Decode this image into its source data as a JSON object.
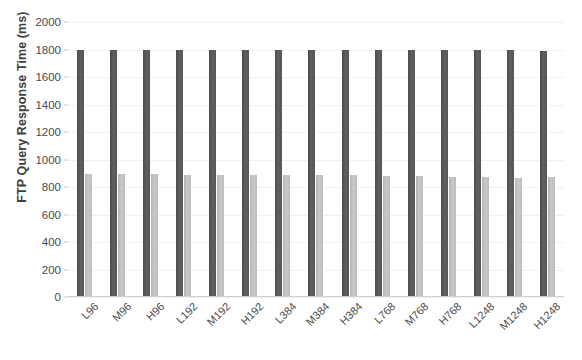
{
  "chart_data": {
    "type": "bar",
    "title": "",
    "xlabel": "",
    "ylabel": "FTP Query Response Time (ms)",
    "ylim": [
      0,
      2000
    ],
    "ytick_step": 200,
    "yticks": [
      0,
      200,
      400,
      600,
      800,
      1000,
      1200,
      1400,
      1600,
      1800,
      2000
    ],
    "grid": true,
    "legend": "none",
    "categories": [
      "L96",
      "M96",
      "H96",
      "L192",
      "M192",
      "H192",
      "L384",
      "M384",
      "H384",
      "L768",
      "M768",
      "H768",
      "L1248",
      "M1248",
      "H1248"
    ],
    "series": [
      {
        "name": "series-1",
        "color": "#565656",
        "values": [
          1800,
          1800,
          1800,
          1800,
          1800,
          1800,
          1800,
          1800,
          1800,
          1800,
          1800,
          1800,
          1800,
          1795,
          1790
        ]
      },
      {
        "name": "series-2",
        "color": "#c0c0c0",
        "values": [
          897,
          895,
          893,
          890,
          888,
          886,
          884,
          890,
          888,
          880,
          878,
          876,
          874,
          866,
          872
        ]
      }
    ]
  },
  "axis": {
    "y_title": "FTP Query Response Time (ms)",
    "y_tick_labels": [
      "2000",
      "1800",
      "1600",
      "1400",
      "1200",
      "1000",
      "800",
      "600",
      "400",
      "200",
      "0"
    ]
  },
  "colors": {
    "series_1": "#565656",
    "series_2": "#c0c0c0",
    "grid": "#f1f1f1",
    "text": "#404040",
    "background": "#ffffff"
  }
}
